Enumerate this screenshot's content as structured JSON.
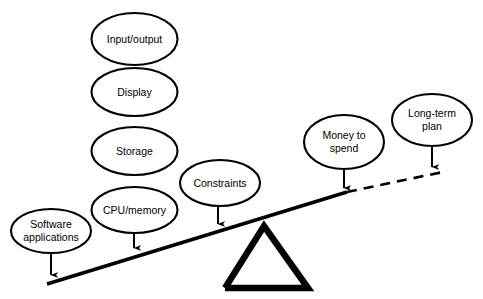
{
  "diagram": {
    "type": "seesaw-balance-diagram",
    "title": "",
    "background_color": "#ffffff",
    "stroke_color": "#000000",
    "left_side": {
      "name": "requirements-side",
      "nodes": [
        {
          "id": "input-output",
          "label": "Input/output",
          "lines": [
            "Input/output"
          ],
          "cx": 134.5,
          "cy": 39,
          "rx": 43,
          "ry": 26
        },
        {
          "id": "display",
          "label": "Display",
          "lines": [
            "Display"
          ],
          "cx": 134.5,
          "cy": 92,
          "rx": 43,
          "ry": 24
        },
        {
          "id": "storage",
          "label": "Storage",
          "lines": [
            "Storage"
          ],
          "cx": 134.5,
          "cy": 151,
          "rx": 43,
          "ry": 24
        },
        {
          "id": "cpu-memory",
          "label": "CPU/memory",
          "lines": [
            "CPU/memory"
          ],
          "cx": 134.5,
          "cy": 210,
          "rx": 43,
          "ry": 23
        },
        {
          "id": "software-apps",
          "label": "Software applications",
          "lines": [
            "Software",
            "applications"
          ],
          "cx": 51,
          "cy": 231,
          "rx": 40,
          "ry": 22
        },
        {
          "id": "constraints",
          "label": "Constraints",
          "lines": [
            "Constraints"
          ],
          "cx": 220,
          "cy": 183,
          "rx": 40,
          "ry": 23
        }
      ]
    },
    "right_side": {
      "name": "resources-side",
      "nodes": [
        {
          "id": "money-to-spend",
          "label": "Money to spend",
          "lines": [
            "Money to",
            "spend"
          ],
          "cx": 344,
          "cy": 142,
          "rx": 40,
          "ry": 27
        },
        {
          "id": "long-term-plan",
          "label": "Long-term plan",
          "lines": [
            "Long-term",
            "plan"
          ],
          "cx": 432,
          "cy": 120,
          "rx": 40,
          "ry": 26
        }
      ]
    },
    "arrows": [
      {
        "id": "arrow-software-apps",
        "from": "software-apps",
        "x1": 51,
        "y1": 253,
        "x2": 51,
        "y2": 279
      },
      {
        "id": "arrow-cpu-memory",
        "from": "cpu-memory",
        "x1": 134,
        "y1": 233,
        "x2": 134,
        "y2": 252
      },
      {
        "id": "arrow-constraints",
        "from": "constraints",
        "x1": 218,
        "y1": 206,
        "x2": 218,
        "y2": 228
      },
      {
        "id": "arrow-money-to-spend",
        "from": "money-to-spend",
        "x1": 344,
        "y1": 169,
        "x2": 344,
        "y2": 192
      },
      {
        "id": "arrow-long-term-plan",
        "from": "long-term-plan",
        "x1": 432,
        "y1": 146,
        "x2": 432,
        "y2": 171
      }
    ],
    "beam": {
      "name": "lever-beam",
      "solid": {
        "x1": 47,
        "y1": 284,
        "x2": 347,
        "y2": 192
      },
      "dashed": {
        "x1": 347,
        "y1": 192,
        "x2": 443,
        "y2": 172
      }
    },
    "fulcrum": {
      "name": "fulcrum-triangle",
      "apex": {
        "x": 264,
        "y": 226
      },
      "base_left": {
        "x": 225,
        "y": 288
      },
      "base_right": {
        "x": 308,
        "y": 288
      }
    }
  }
}
